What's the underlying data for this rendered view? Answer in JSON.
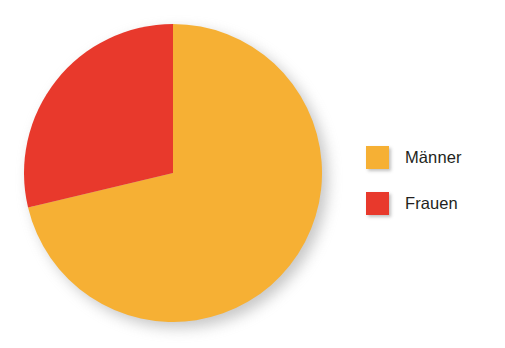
{
  "background_color": "#ffffff",
  "chart_data": {
    "type": "pie",
    "title": "",
    "subtitle": "",
    "xlabel": "",
    "ylabel": "",
    "grid": false,
    "legend_position": "right",
    "start_angle_deg": 0,
    "direction": "counterclockwise",
    "categories": [
      "Männer",
      "Frauen"
    ],
    "values": [
      71,
      29
    ],
    "unit": "%",
    "colors": [
      "#f6b034",
      "#e8392c"
    ],
    "slices": [
      {
        "label": "Männer",
        "value": 71,
        "color": "#f6b034",
        "start_deg": 103.4,
        "sweep_deg": 256.6
      },
      {
        "label": "Frauen",
        "value": 29,
        "color": "#e8392c",
        "start_deg": 0,
        "sweep_deg": 103.4
      }
    ],
    "annotations": []
  },
  "legend": {
    "items": [
      {
        "label": "Männer",
        "color": "#f6b034",
        "swatch_icon": "legend-color-swatch"
      },
      {
        "label": "Frauen",
        "color": "#e8392c",
        "swatch_icon": "legend-color-swatch"
      }
    ]
  }
}
